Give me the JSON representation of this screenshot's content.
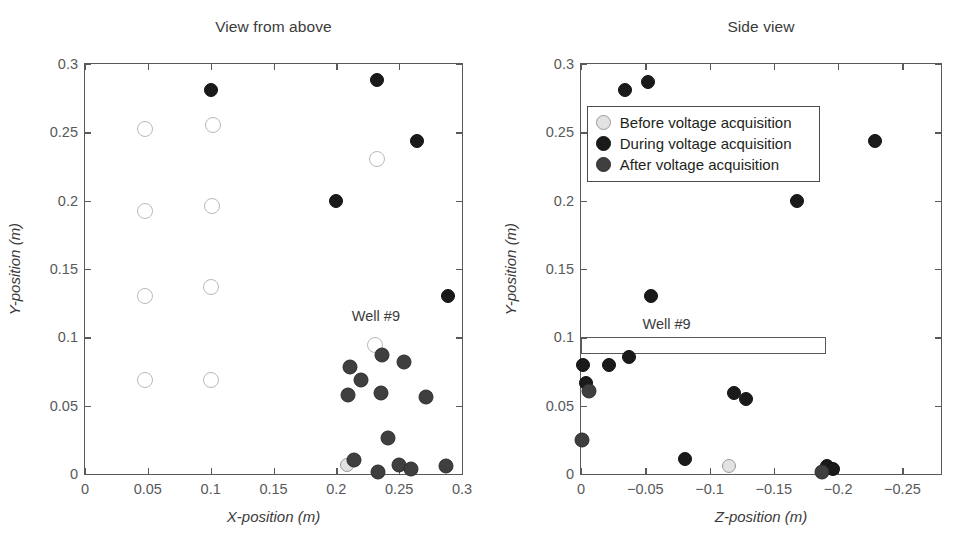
{
  "figure": {
    "background": "#ffffff",
    "text_color": "#231f20"
  },
  "colors": {
    "before": "#e2e2e2",
    "before_edge": "#9a9a9a",
    "during": "#1a1a1a",
    "after": "#3f3f3f",
    "axis": "#58595b",
    "annotation": "#3b3b3b"
  },
  "legend": {
    "position": "upper-center-right",
    "entries": [
      {
        "label": "Before voltage acquisition",
        "marker": "before-circle-icon",
        "style": "before"
      },
      {
        "label": "During voltage acquisition",
        "marker": "during-circle-icon",
        "style": "during"
      },
      {
        "label": "After voltage acquisition",
        "marker": "after-circle-icon",
        "style": "after"
      }
    ]
  },
  "chart_data": [
    {
      "type": "scatter",
      "title": "View from above",
      "xlabel": "X-position (m)",
      "ylabel": "Y-position (m)",
      "xlim": [
        0,
        0.3
      ],
      "ylim": [
        0,
        0.3
      ],
      "xticks": [
        0,
        0.05,
        0.1,
        0.15,
        0.2,
        0.25,
        0.3
      ],
      "xticklabels": [
        "0",
        "0.05",
        "0.1",
        "0.15",
        "0.2",
        "0.25",
        "0.3"
      ],
      "yticks": [
        0,
        0.05,
        0.1,
        0.15,
        0.2,
        0.25,
        0.3
      ],
      "yticklabels": [
        "0",
        "0.05",
        "0.1",
        "0.15",
        "0.2",
        "0.25",
        "0.3"
      ],
      "grid": false,
      "annotations": [
        {
          "text": "Well #9",
          "x": 0.2315,
          "y": 0.1155
        }
      ],
      "series": [
        {
          "name": "Before voltage acquisition",
          "style": "before-open",
          "points": [
            {
              "x": 0.048,
              "y": 0.2525
            },
            {
              "x": 0.1015,
              "y": 0.2555
            },
            {
              "x": 0.0475,
              "y": 0.1925
            },
            {
              "x": 0.101,
              "y": 0.196
            },
            {
              "x": 0.048,
              "y": 0.1305
            },
            {
              "x": 0.1,
              "y": 0.137
            },
            {
              "x": 0.048,
              "y": 0.069
            },
            {
              "x": 0.1,
              "y": 0.0688
            },
            {
              "x": 0.232,
              "y": 0.2305
            },
            {
              "x": 0.231,
              "y": 0.0945
            }
          ]
        },
        {
          "name": "Before voltage acquisition (filled)",
          "style": "before",
          "points": [
            {
              "x": 0.2085,
              "y": 0.0065
            }
          ]
        },
        {
          "name": "During voltage acquisition",
          "style": "during",
          "points": [
            {
              "x": 0.1005,
              "y": 0.281
            },
            {
              "x": 0.232,
              "y": 0.288
            },
            {
              "x": 0.2645,
              "y": 0.244
            },
            {
              "x": 0.2,
              "y": 0.1995
            },
            {
              "x": 0.2885,
              "y": 0.1305
            }
          ]
        },
        {
          "name": "After voltage acquisition",
          "style": "after",
          "points": [
            {
              "x": 0.236,
              "y": 0.087
            },
            {
              "x": 0.2105,
              "y": 0.0785
            },
            {
              "x": 0.2535,
              "y": 0.082
            },
            {
              "x": 0.22,
              "y": 0.0685
            },
            {
              "x": 0.2095,
              "y": 0.0575
            },
            {
              "x": 0.2355,
              "y": 0.0595
            },
            {
              "x": 0.2715,
              "y": 0.056
            },
            {
              "x": 0.2415,
              "y": 0.026
            },
            {
              "x": 0.214,
              "y": 0.0105
            },
            {
              "x": 0.2335,
              "y": 0.0015
            },
            {
              "x": 0.25,
              "y": 0.0065
            },
            {
              "x": 0.2595,
              "y": 0.0035
            },
            {
              "x": 0.2875,
              "y": 0.006
            }
          ]
        }
      ]
    },
    {
      "type": "scatter",
      "title": "Side view",
      "xlabel": "Z-position (m)",
      "ylabel": "Y-position (m)",
      "xlim": [
        0,
        -0.28
      ],
      "ylim": [
        0,
        0.3
      ],
      "xticks": [
        0,
        -0.05,
        -0.1,
        -0.15,
        -0.2,
        -0.25
      ],
      "xticklabels": [
        "0",
        "−0.05",
        "−0.1",
        "−0.15",
        "−0.2",
        "−0.25"
      ],
      "yticks": [
        0,
        0.05,
        0.1,
        0.15,
        0.2,
        0.25,
        0.3
      ],
      "yticklabels": [
        "0",
        "0.05",
        "0.1",
        "0.15",
        "0.2",
        "0.25",
        "0.3"
      ],
      "grid": false,
      "annotations": [
        {
          "text": "Well #9",
          "x": -0.0665,
          "y": 0.1095
        }
      ],
      "boxes": [
        {
          "name": "well-9-outline",
          "x0": 0.0,
          "x1": -0.1905,
          "y0": 0.088,
          "y1": 0.1
        }
      ],
      "series": [
        {
          "name": "Before voltage acquisition",
          "style": "before",
          "points": [
            {
              "x": -0.115,
              "y": 0.0055
            }
          ]
        },
        {
          "name": "During voltage acquisition",
          "style": "during",
          "points": [
            {
              "x": -0.0345,
              "y": 0.281
            },
            {
              "x": -0.052,
              "y": 0.2865
            },
            {
              "x": -0.229,
              "y": 0.244
            },
            {
              "x": -0.168,
              "y": 0.2
            },
            {
              "x": -0.0545,
              "y": 0.13
            },
            {
              "x": -0.0015,
              "y": 0.08
            },
            {
              "x": -0.022,
              "y": 0.0795
            },
            {
              "x": -0.037,
              "y": 0.0855
            },
            {
              "x": -0.0035,
              "y": 0.0665
            },
            {
              "x": -0.119,
              "y": 0.0595
            },
            {
              "x": -0.128,
              "y": 0.055
            },
            {
              "x": -0.0805,
              "y": 0.011
            },
            {
              "x": -0.1915,
              "y": 0.0055
            },
            {
              "x": -0.196,
              "y": 0.0035
            }
          ]
        },
        {
          "name": "After voltage acquisition",
          "style": "after",
          "points": [
            {
              "x": -0.006,
              "y": 0.061
            },
            {
              "x": -0.001,
              "y": 0.025
            },
            {
              "x": -0.1875,
              "y": 0.0015
            }
          ]
        }
      ]
    }
  ]
}
